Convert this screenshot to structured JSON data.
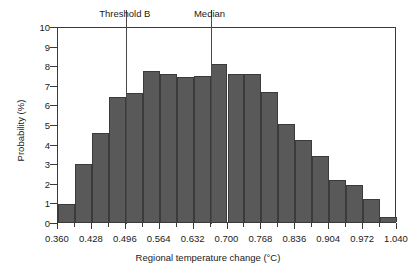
{
  "chart_data": {
    "type": "bar",
    "title": "",
    "xlabel": "Regional temperature change (°C)",
    "ylabel": "Probability (%)",
    "xlim": [
      0.36,
      1.04
    ],
    "ylim": [
      0,
      10
    ],
    "grid": false,
    "legend": "none",
    "bin_width": 0.034,
    "bar_color": "#595959",
    "bin_starts": [
      0.36,
      0.394,
      0.428,
      0.462,
      0.496,
      0.53,
      0.564,
      0.598,
      0.632,
      0.666,
      0.7,
      0.734,
      0.768,
      0.802,
      0.836,
      0.87,
      0.904,
      0.938,
      0.972,
      1.006
    ],
    "categories": [
      "0.360-0.394",
      "0.394-0.428",
      "0.428-0.462",
      "0.462-0.496",
      "0.496-0.530",
      "0.530-0.564",
      "0.564-0.598",
      "0.598-0.632",
      "0.632-0.666",
      "0.666-0.700",
      "0.700-0.734",
      "0.734-0.768",
      "0.768-0.802",
      "0.802-0.836",
      "0.836-0.870",
      "0.870-0.904",
      "0.904-0.938",
      "0.938-0.972",
      "0.972-1.006",
      "1.006-1.040"
    ],
    "values": [
      0.9,
      2.95,
      4.55,
      6.4,
      6.6,
      7.7,
      7.55,
      7.4,
      7.45,
      8.05,
      7.55,
      7.55,
      6.65,
      5.0,
      4.2,
      3.35,
      2.15,
      1.9,
      1.15,
      0.25
    ],
    "x_ticks": [
      0.36,
      0.428,
      0.496,
      0.564,
      0.632,
      0.7,
      0.768,
      0.836,
      0.904,
      0.972,
      1.04
    ],
    "x_tick_labels": [
      "0.360",
      "0.428",
      "0.496",
      "0.564",
      "0.632",
      "0.700",
      "0.768",
      "0.836",
      "0.904",
      "0.972",
      "1.040"
    ],
    "y_ticks": [
      0,
      1,
      2,
      3,
      4,
      5,
      6,
      7,
      8,
      9,
      10
    ],
    "y_tick_labels": [
      "0",
      "1",
      "2",
      "3",
      "4",
      "5",
      "6",
      "7",
      "8",
      "9",
      "10"
    ],
    "annotations": [
      {
        "label": "Threshold B",
        "x": 0.496,
        "type": "vertical-line"
      },
      {
        "label": "Median",
        "x": 0.666,
        "type": "vertical-line"
      }
    ]
  }
}
